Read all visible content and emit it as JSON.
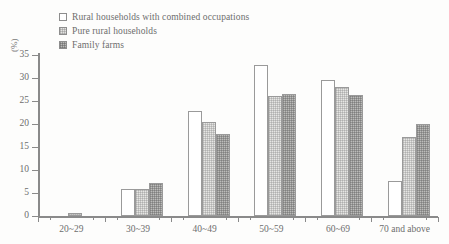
{
  "chart_data": {
    "type": "bar",
    "title": "",
    "subtitle": "",
    "xlabel": "",
    "ylabel": "(%)",
    "ylim": [
      0,
      35
    ],
    "ytick_values": [
      0,
      5,
      10,
      15,
      20,
      25,
      30,
      35
    ],
    "ytick_labels": [
      "0",
      "5",
      "10",
      "15",
      "20",
      "25",
      "30",
      "35"
    ],
    "grid": false,
    "legend_position": "top-left",
    "categories": [
      "20~29",
      "30~39",
      "40~49",
      "50~59",
      "60~69",
      "70 and above"
    ],
    "series": [
      {
        "name": "Rural households with combined occupations",
        "swatch": "white",
        "color": "#ffffff",
        "values": [
          0,
          5.9,
          22.8,
          32.8,
          29.5,
          7.7
        ]
      },
      {
        "name": "Pure rural households",
        "swatch": "light-gray-dotted",
        "color": "#e6e6e4",
        "values": [
          0.6,
          5.9,
          20.4,
          26.0,
          28.1,
          17.1
        ]
      },
      {
        "name": "Family farms",
        "swatch": "medium-gray-checkered",
        "color": "#bcbcba",
        "values": [
          0,
          7.2,
          17.8,
          26.5,
          26.3,
          19.9
        ]
      }
    ]
  },
  "axis": {
    "y_title": "(%)"
  },
  "legend": {
    "items": [
      {
        "label": "Rural households with combined occupations"
      },
      {
        "label": "Pure rural households"
      },
      {
        "label": "Family farms"
      }
    ]
  }
}
